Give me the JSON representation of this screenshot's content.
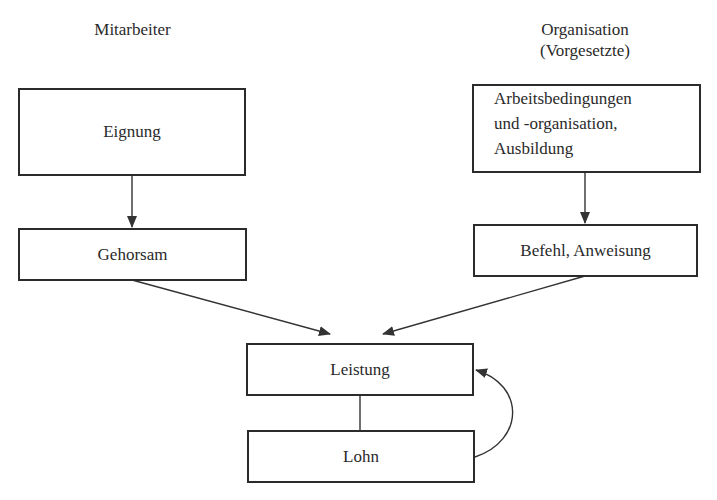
{
  "diagram": {
    "headers": {
      "left": "Mitarbeiter",
      "right_line1": "Organisation",
      "right_line2": "(Vorgesetzte)"
    },
    "nodes": {
      "eignung": "Eignung",
      "gehorsam": "Gehorsam",
      "arbeitsbedingungen_line1": "Arbeitsbedingungen",
      "arbeitsbedingungen_line2": "und -organisation,",
      "arbeitsbedingungen_line3": "Ausbildung",
      "befehl": "Befehl, Anweisung",
      "leistung": "Leistung",
      "lohn": "Lohn"
    },
    "edges": [
      {
        "from": "Eignung",
        "to": "Gehorsam",
        "type": "arrow"
      },
      {
        "from": "Arbeitsbedingungen und -organisation, Ausbildung",
        "to": "Befehl, Anweisung",
        "type": "arrow"
      },
      {
        "from": "Gehorsam",
        "to": "Leistung",
        "type": "arrow"
      },
      {
        "from": "Befehl, Anweisung",
        "to": "Leistung",
        "type": "arrow"
      },
      {
        "from": "Leistung",
        "to": "Lohn",
        "type": "line"
      },
      {
        "from": "Lohn",
        "to": "Leistung",
        "type": "curved-arrow"
      }
    ]
  }
}
